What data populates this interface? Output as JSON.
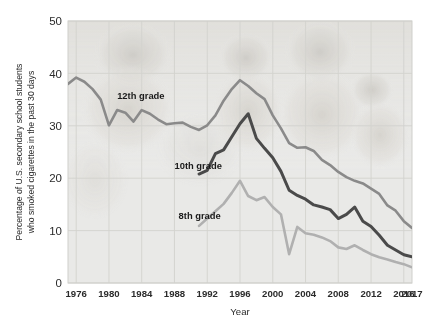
{
  "chart_data": {
    "type": "line",
    "title": "",
    "xlabel": "Year",
    "ylabel": "Percentage of U.S. secondary school students who smoked cigarettes in the past 30 days",
    "ylabel_line1": "Percentage of U.S. secondary school students",
    "ylabel_line2": "who smoked cigarettes in the past 30 days",
    "xlim": [
      1975,
      2017
    ],
    "ylim": [
      0,
      50
    ],
    "yticks": [
      0,
      10,
      20,
      30,
      40,
      50
    ],
    "ytick_labels": [
      "0",
      "10",
      "20",
      "30",
      "40",
      "50"
    ],
    "xticks": [
      1976,
      1980,
      1984,
      1988,
      1992,
      1996,
      2000,
      2004,
      2008,
      2012,
      2016,
      2017
    ],
    "xtick_labels": [
      "1976",
      "1980",
      "1984",
      "1988",
      "1992",
      "1996",
      "2000",
      "2004",
      "2008",
      "2012",
      "2016",
      "2017"
    ],
    "grid": true,
    "legend_position": "inline-annotations",
    "series": [
      {
        "name": "12th grade",
        "label": "12th grade",
        "color": "#8a8a8a",
        "label_x": 1981.0,
        "label_y": 35.2,
        "x": [
          1975,
          1976,
          1977,
          1978,
          1979,
          1980,
          1981,
          1982,
          1983,
          1984,
          1985,
          1986,
          1987,
          1988,
          1989,
          1990,
          1991,
          1992,
          1993,
          1994,
          1995,
          1996,
          1997,
          1998,
          1999,
          2000,
          2001,
          2002,
          2003,
          2004,
          2005,
          2006,
          2007,
          2008,
          2009,
          2010,
          2011,
          2012,
          2013,
          2014,
          2015,
          2016,
          2017
        ],
        "values": [
          38.0,
          39.2,
          38.4,
          37.0,
          35.0,
          30.1,
          33.0,
          32.5,
          30.8,
          33.0,
          32.3,
          31.2,
          30.3,
          30.5,
          30.6,
          29.8,
          29.2,
          30.1,
          32.0,
          34.8,
          37.0,
          38.7,
          37.6,
          36.2,
          35.1,
          32.0,
          29.5,
          26.7,
          25.8,
          25.9,
          25.2,
          23.5,
          22.5,
          21.2,
          20.2,
          19.5,
          19.0,
          18.0,
          17.0,
          14.8,
          13.8,
          11.8,
          10.5
        ]
      },
      {
        "name": "10th grade",
        "label": "10th grade",
        "color": "#4a4a4a",
        "label_x": 1988.0,
        "label_y": 21.8,
        "x": [
          1991,
          1992,
          1993,
          1994,
          1995,
          1996,
          1997,
          1998,
          1999,
          2000,
          2001,
          2002,
          2003,
          2004,
          2005,
          2006,
          2007,
          2008,
          2009,
          2010,
          2011,
          2012,
          2013,
          2014,
          2015,
          2016,
          2017
        ],
        "values": [
          20.8,
          21.5,
          24.7,
          25.4,
          27.9,
          30.4,
          32.3,
          27.6,
          25.7,
          23.9,
          21.3,
          17.7,
          16.7,
          16.0,
          14.9,
          14.5,
          14.0,
          12.3,
          13.1,
          14.5,
          11.8,
          10.8,
          9.1,
          7.2,
          6.3,
          5.4,
          5.0
        ]
      },
      {
        "name": "8th grade",
        "label": "8th grade",
        "color": "#b0b0b0",
        "label_x": 1988.5,
        "label_y": 12.2,
        "x": [
          1991,
          1992,
          1993,
          1994,
          1995,
          1996,
          1997,
          1998,
          1999,
          2000,
          2001,
          2002,
          2003,
          2004,
          2005,
          2006,
          2007,
          2008,
          2009,
          2010,
          2011,
          2012,
          2013,
          2014,
          2015,
          2016,
          2017
        ],
        "values": [
          10.9,
          12.3,
          13.7,
          15.1,
          17.2,
          19.5,
          16.6,
          15.8,
          16.4,
          14.5,
          13.1,
          5.5,
          10.7,
          9.5,
          9.2,
          8.7,
          8.0,
          6.8,
          6.5,
          7.2,
          6.3,
          5.5,
          4.9,
          4.5,
          4.0,
          3.6,
          3.0
        ]
      }
    ]
  },
  "background": {
    "plot_bg": "#e8e8e6",
    "grid_color": "#d2d2ce",
    "ghost_photo": "faded-students-photo"
  }
}
